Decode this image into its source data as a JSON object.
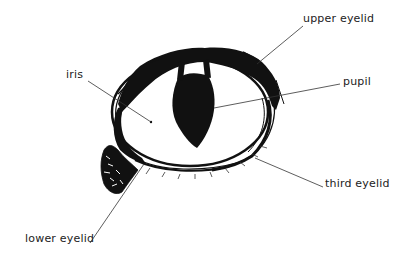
{
  "diagram": {
    "colors": {
      "ink": "#111111",
      "label": "#222222",
      "background": "#ffffff"
    },
    "labels": [
      {
        "id": "upper-eyelid",
        "text": "upper eyelid",
        "x": 303,
        "y": 13,
        "line": [
          303,
          26,
          257,
          64
        ]
      },
      {
        "id": "pupil",
        "text": "pupil",
        "x": 343,
        "y": 76,
        "line": [
          340,
          84,
          214,
          108
        ]
      },
      {
        "id": "iris",
        "text": "iris",
        "x": 66,
        "y": 69,
        "line": [
          88,
          81,
          151,
          122
        ]
      },
      {
        "id": "third-eyelid",
        "text": "third eyelid",
        "x": 325,
        "y": 178,
        "line": [
          323,
          187,
          255,
          158
        ]
      },
      {
        "id": "lower-eyelid",
        "text": "lower eyelid",
        "x": 25,
        "y": 233,
        "line": [
          90,
          243,
          144,
          164
        ]
      }
    ]
  }
}
